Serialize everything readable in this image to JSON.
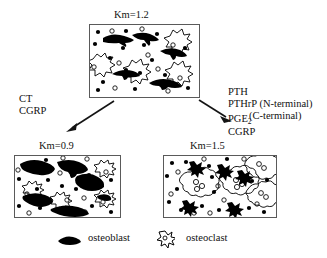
{
  "figure": {
    "type": "biological-schematic"
  },
  "panels": [
    {
      "id": "top",
      "km_label": "Km=1.2",
      "osteoblast_count": 5,
      "osteoclast_count": 4,
      "dot_count": 26
    },
    {
      "id": "bottom-left",
      "km_label": "Km=0.9",
      "osteoblast_count": 6,
      "osteoclast_count": 4,
      "dot_count": 24
    },
    {
      "id": "bottom-right",
      "km_label": "Km=1.5",
      "osteoblast_count": 5,
      "osteoclast_count": 4,
      "dot_count": 26
    }
  ],
  "left_pathway": {
    "lines": [
      "CT",
      "CGRP"
    ],
    "arrow_name": "arrow-to-km-0-9"
  },
  "right_pathway": {
    "lines": [
      "PTH",
      "PTHrP (N-terminal)"
    ],
    "indented_line": "(C-terminal)",
    "pge_prefix": "PGE",
    "pge_subscript": "2",
    "cgrp": "CGRP",
    "arrow_name": "arrow-to-km-1-5"
  },
  "legend": {
    "osteoblast_label": "osteoblast",
    "osteoclast_label": "osteoclast"
  },
  "colors": {
    "ink": "#141414",
    "cell_fill": "#000000",
    "border": "#5a5a5a",
    "background": "#ffffff"
  }
}
